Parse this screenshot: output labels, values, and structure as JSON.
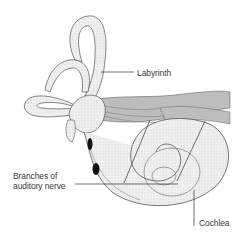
{
  "diagram": {
    "labels": {
      "labyrinth": "Labyrinth",
      "branches_line1": "Branches of",
      "branches_line2": "auditory nerve",
      "cochlea": "Cochlea"
    },
    "colors": {
      "background": "#ffffff",
      "structure_fill": "#efefef",
      "outline": "#555555",
      "nerve": "#9a9a9a",
      "leader_line": "#333333",
      "spot": "#111111"
    }
  }
}
